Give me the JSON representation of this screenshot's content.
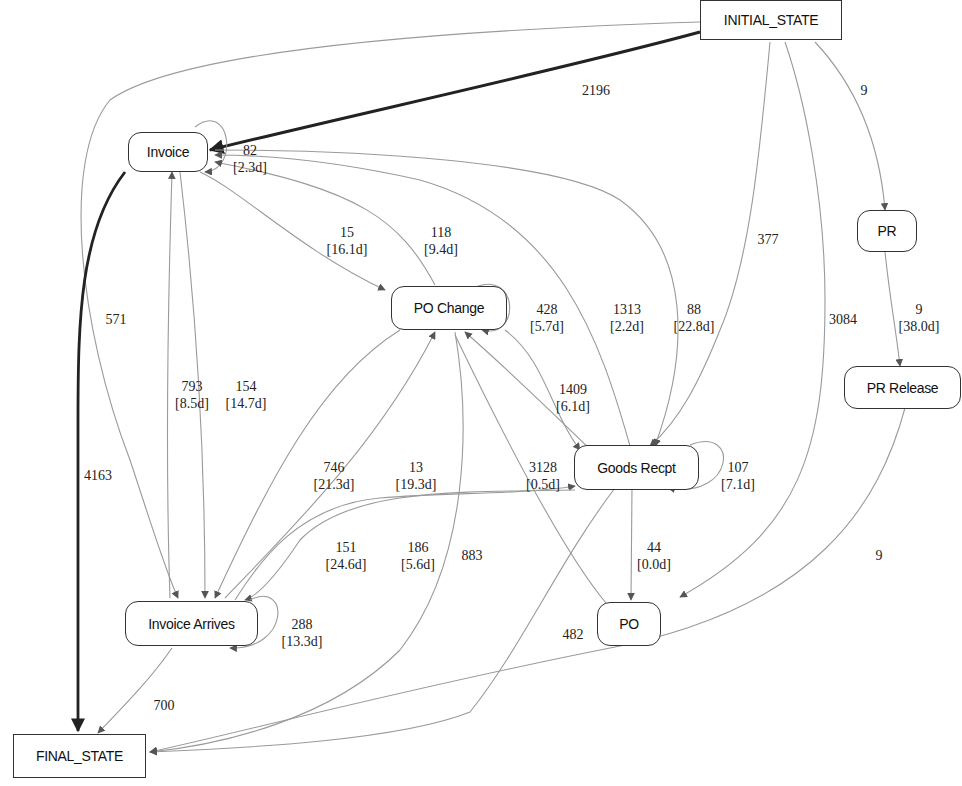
{
  "diagram": {
    "type": "process-map",
    "nodes": {
      "initial_state": {
        "label": "INITIAL_STATE"
      },
      "invoice": {
        "label": "Invoice"
      },
      "pr": {
        "label": "PR"
      },
      "po_change": {
        "label": "PO Change"
      },
      "pr_release": {
        "label": "PR Release"
      },
      "goods_recpt": {
        "label": "Goods Recpt"
      },
      "invoice_arrives": {
        "label": "Invoice Arrives"
      },
      "po": {
        "label": "PO"
      },
      "final_state": {
        "label": "FINAL_STATE"
      }
    },
    "edges": [
      {
        "id": "e_init_invoice",
        "from": "INITIAL_STATE",
        "to": "Invoice",
        "count": "2196",
        "duration": ""
      },
      {
        "id": "e_init_pr",
        "from": "INITIAL_STATE",
        "to": "PR",
        "count": "9",
        "duration": ""
      },
      {
        "id": "e_init_goods",
        "from": "INITIAL_STATE",
        "to": "Goods Recpt",
        "count": "377",
        "duration": ""
      },
      {
        "id": "e_init_po",
        "from": "INITIAL_STATE",
        "to": "PO",
        "count": "3084",
        "duration": ""
      },
      {
        "id": "e_init_invarr",
        "from": "INITIAL_STATE",
        "to": "Invoice Arrives",
        "count": "571",
        "duration": ""
      },
      {
        "id": "e_invoice_self",
        "from": "Invoice",
        "to": "Invoice",
        "count": "82",
        "duration": "[2.3d]"
      },
      {
        "id": "e_invoice_pochange",
        "from": "Invoice",
        "to": "PO Change",
        "count": "15",
        "duration": "[16.1d]"
      },
      {
        "id": "e_pochange_invoice",
        "from": "PO Change",
        "to": "Invoice",
        "count": "118",
        "duration": "[9.4d]"
      },
      {
        "id": "e_pochange_self",
        "from": "PO Change",
        "to": "PO Change",
        "count": "428",
        "duration": "[5.7d]"
      },
      {
        "id": "e_goods_invoice",
        "from": "Goods Recpt",
        "to": "Invoice",
        "count": "1313",
        "duration": "[2.2d]"
      },
      {
        "id": "e_invoice_goods",
        "from": "Invoice",
        "to": "Goods Recpt",
        "count": "88",
        "duration": "[22.8d]"
      },
      {
        "id": "e_pr_prrelease",
        "from": "PR",
        "to": "PR Release",
        "count": "9",
        "duration": "[38.0d]"
      },
      {
        "id": "e_invarr_invoice",
        "from": "Invoice Arrives",
        "to": "Invoice",
        "count": "793",
        "duration": "[8.5d]"
      },
      {
        "id": "e_invoice_invarr",
        "from": "Invoice",
        "to": "Invoice Arrives",
        "count": "154",
        "duration": "[14.7d]"
      },
      {
        "id": "e_pochange_goods",
        "from": "PO Change",
        "to": "Goods Recpt",
        "count": "1409",
        "duration": "[6.1d]"
      },
      {
        "id": "e_invoice_final",
        "from": "Invoice",
        "to": "FINAL_STATE",
        "count": "4163",
        "duration": ""
      },
      {
        "id": "e_pochange_invarr",
        "from": "PO Change",
        "to": "Invoice Arrives",
        "count": "746",
        "duration": "[21.3d]"
      },
      {
        "id": "e_invarr_pochange",
        "from": "Invoice Arrives",
        "to": "PO Change",
        "count": "13",
        "duration": "[19.3d]"
      },
      {
        "id": "e_goods_pochange",
        "from": "Goods Recpt",
        "to": "PO Change",
        "count": "3128",
        "duration": "[0.5d]"
      },
      {
        "id": "e_goods_self",
        "from": "Goods Recpt",
        "to": "Goods Recpt",
        "count": "107",
        "duration": "[7.1d]"
      },
      {
        "id": "e_invarr_goods",
        "from": "Invoice Arrives",
        "to": "Goods Recpt",
        "count": "151",
        "duration": "[24.6d]"
      },
      {
        "id": "e_goods_invarr",
        "from": "Goods Recpt",
        "to": "Invoice Arrives",
        "count": "186",
        "duration": "[5.6d]"
      },
      {
        "id": "e_pochange_final",
        "from": "PO Change",
        "to": "FINAL_STATE",
        "count": "883",
        "duration": ""
      },
      {
        "id": "e_goods_po",
        "from": "Goods Recpt",
        "to": "PO",
        "count": "44",
        "duration": "[0.0d]"
      },
      {
        "id": "e_prrelease_final",
        "from": "PR Release",
        "to": "FINAL_STATE",
        "count": "9",
        "duration": ""
      },
      {
        "id": "e_invarr_self",
        "from": "Invoice Arrives",
        "to": "Invoice Arrives",
        "count": "288",
        "duration": "[13.3d]"
      },
      {
        "id": "e_goods_final",
        "from": "Goods Recpt",
        "to": "FINAL_STATE",
        "count": "482",
        "duration": ""
      },
      {
        "id": "e_invarr_final",
        "from": "Invoice Arrives",
        "to": "FINAL_STATE",
        "count": "700",
        "duration": ""
      }
    ],
    "colors": {
      "background": "#ffffff",
      "node_border": "#333333",
      "thin_edge": "#9a9a9a",
      "thick_edge": "#222222",
      "text": "#222222"
    }
  }
}
